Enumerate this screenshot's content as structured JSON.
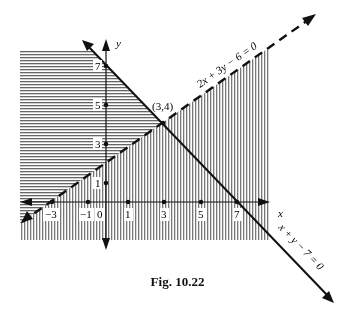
{
  "figure": {
    "caption": "Fig. 10.22",
    "axis_labels": {
      "x": "x",
      "y": "y"
    },
    "x_ticks": [
      {
        "label": "−3",
        "value": -3
      },
      {
        "label": "−1",
        "value": -1
      },
      {
        "label": "0",
        "value": 0
      },
      {
        "label": "1",
        "value": 1
      },
      {
        "label": "3",
        "value": 3
      },
      {
        "label": "5",
        "value": 5
      },
      {
        "label": "7",
        "value": 7
      }
    ],
    "y_ticks": [
      {
        "label": "1",
        "value": 1
      },
      {
        "label": "3",
        "value": 3
      },
      {
        "label": "5",
        "value": 5
      },
      {
        "label": "7",
        "value": 7
      }
    ],
    "lines": [
      {
        "equation": "2x + 3y − 6 = 0",
        "style": "dashed"
      },
      {
        "equation": "x + y − 7 = 0",
        "style": "solid"
      }
    ],
    "intersection": {
      "label": "(3,4)",
      "x": 3,
      "y": 4
    },
    "shading": {
      "horizontal_hatch": "x + y ≤ 7",
      "vertical_hatch": "2x + 3y ≥ 6 region (below-right of dashed line)",
      "crosshatch": "overlap of both regions"
    },
    "colors": {
      "ink": "#111111",
      "hatch": "#555555",
      "background": "#ffffff"
    }
  }
}
